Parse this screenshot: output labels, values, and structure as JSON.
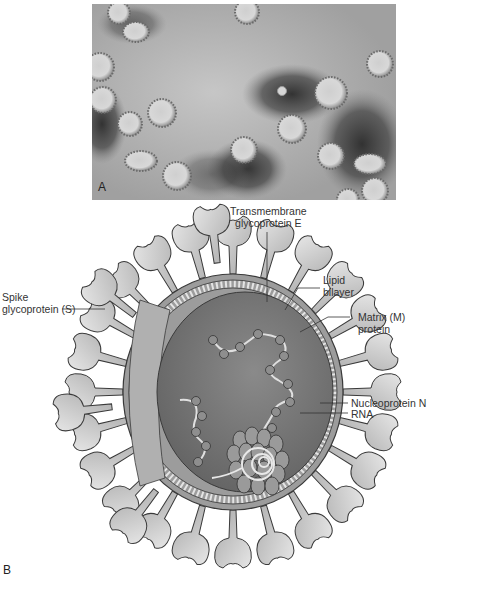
{
  "panel_a": {
    "label": "A",
    "description": "Electron micrograph of coronavirus particles"
  },
  "panel_b": {
    "label": "B",
    "description": "Schematic of coronavirus structure"
  },
  "labels": {
    "transmembrane": [
      "Transmembrane",
      "glycoprotein E"
    ],
    "lipid": [
      "Lipid",
      "bilayer"
    ],
    "spike": [
      "Spike",
      "glycoprotein (S)"
    ],
    "matrix": [
      "Matrix (M)",
      "protein"
    ],
    "nucleoprotein": [
      "Nucleoprotein N"
    ],
    "rna": [
      "RNA"
    ]
  },
  "colors": {
    "micro_bg": "#b4b4b4",
    "particle": "#d2d2d2",
    "dark_stain": "#3c3c3c",
    "core": "#7c7c7c",
    "envelope": "#9a9a9a",
    "spike": "#c4c4c4",
    "outline": "#3a3a3a"
  }
}
